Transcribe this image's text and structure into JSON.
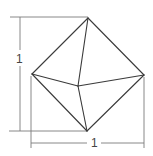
{
  "diagram": {
    "type": "octahedron-dimensioned",
    "colors": {
      "edge": "#3a3a3a",
      "dimension": "#7a7a7a",
      "label": "#444444"
    },
    "vertices": {
      "top": [
        88,
        18
      ],
      "left": [
        32,
        74
      ],
      "right": [
        144,
        75
      ],
      "center": [
        78,
        86
      ],
      "bottom": [
        87,
        131
      ]
    },
    "dimensions": {
      "height_label": "1",
      "width_label": "1"
    }
  }
}
